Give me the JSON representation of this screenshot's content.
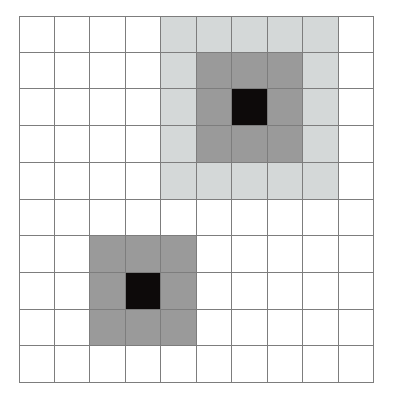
{
  "figure": {
    "kind": "grid-heatmap",
    "title": "",
    "background_color": "#ffffff",
    "gridline_color": "#7d7d7d",
    "gridline_width_px": 1,
    "rows": 10,
    "columns": 10,
    "origin_px": {
      "x": 19,
      "y": 16
    },
    "cell_size_px": {
      "width": 35.5,
      "height": 36.7
    }
  },
  "palette": {
    "empty": "#ffffff",
    "light_gray": "#d4d8d8",
    "medium_gray": "#9a9a9a",
    "black": "#0d0a0a"
  },
  "legend": {
    "levels": [
      {
        "name": "empty",
        "color": "#ffffff",
        "value": 0
      },
      {
        "name": "light_gray",
        "color": "#d4d8d8",
        "value": 1
      },
      {
        "name": "medium_gray",
        "color": "#9a9a9a",
        "value": 2
      },
      {
        "name": "black",
        "color": "#0d0a0a",
        "value": 3
      }
    ]
  },
  "regions": [
    {
      "name": "upper-right-concentric-pattern",
      "layers": [
        {
          "level": "light_gray",
          "rows": [
            1,
            5
          ],
          "columns": [
            5,
            9
          ]
        },
        {
          "level": "medium_gray",
          "rows": [
            2,
            4
          ],
          "columns": [
            6,
            8
          ]
        },
        {
          "level": "black",
          "rows": [
            3,
            3
          ],
          "columns": [
            7,
            7
          ]
        }
      ],
      "center_cell": {
        "row": 3,
        "column": 7
      }
    },
    {
      "name": "lower-left-concentric-pattern",
      "layers": [
        {
          "level": "medium_gray",
          "rows": [
            7,
            9
          ],
          "columns": [
            3,
            5
          ]
        },
        {
          "level": "black",
          "rows": [
            8,
            8
          ],
          "columns": [
            4,
            4
          ]
        }
      ],
      "center_cell": {
        "row": 8,
        "column": 4
      }
    }
  ],
  "chart_data": {
    "type": "heatmap",
    "title": "",
    "xlabel": "",
    "ylabel": "",
    "grid": true,
    "legend_position": "none",
    "categories": [
      "1",
      "2",
      "3",
      "4",
      "5",
      "6",
      "7",
      "8",
      "9",
      "10"
    ],
    "x": [
      "1",
      "2",
      "3",
      "4",
      "5",
      "6",
      "7",
      "8",
      "9",
      "10"
    ],
    "xlim": [
      1,
      10
    ],
    "ylim": [
      1,
      10
    ],
    "value_labels": {
      "0": "empty",
      "1": "light_gray",
      "2": "medium_gray",
      "3": "black"
    },
    "values": [
      [
        0,
        0,
        0,
        0,
        1,
        1,
        1,
        1,
        1,
        0
      ],
      [
        0,
        0,
        0,
        0,
        1,
        2,
        2,
        2,
        1,
        0
      ],
      [
        0,
        0,
        0,
        0,
        1,
        2,
        3,
        2,
        1,
        0
      ],
      [
        0,
        0,
        0,
        0,
        1,
        2,
        2,
        2,
        1,
        0
      ],
      [
        0,
        0,
        0,
        0,
        1,
        1,
        1,
        1,
        1,
        0
      ],
      [
        0,
        0,
        0,
        0,
        0,
        0,
        0,
        0,
        0,
        0
      ],
      [
        0,
        0,
        2,
        2,
        2,
        0,
        0,
        0,
        0,
        0
      ],
      [
        0,
        0,
        2,
        3,
        2,
        0,
        0,
        0,
        0,
        0
      ],
      [
        0,
        0,
        2,
        2,
        2,
        0,
        0,
        0,
        0,
        0
      ],
      [
        0,
        0,
        0,
        0,
        0,
        0,
        0,
        0,
        0,
        0
      ]
    ]
  }
}
